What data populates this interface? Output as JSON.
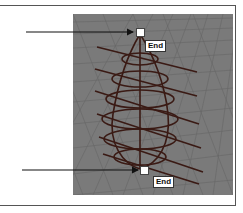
{
  "figure": {
    "labels": {
      "top": "End",
      "bottom": "End"
    },
    "colors": {
      "viewport_bg": "#7a7a7a",
      "curve": "#3a1a14",
      "grid": "#5e5e5e",
      "handle": "#ffffff",
      "arrow": "#111111"
    }
  }
}
